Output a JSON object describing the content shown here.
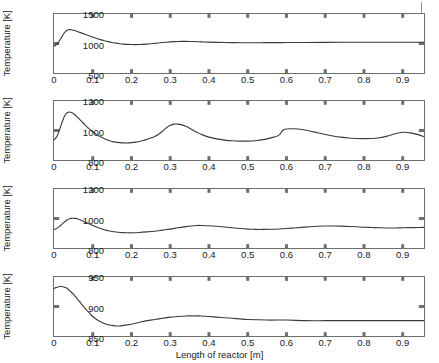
{
  "figure": {
    "xlabel": "Length of reactor [m]",
    "ylabel": "Temperature [K]",
    "x_ticks": [
      "0",
      "0.1",
      "0.2",
      "0.3",
      "0.4",
      "0.5",
      "0.6",
      "0.7",
      "0.8",
      "0.9"
    ],
    "x_tick_values": [
      0,
      0.1,
      0.2,
      0.3,
      0.4,
      0.5,
      0.6,
      0.7,
      0.8,
      0.9
    ],
    "xlim": [
      0,
      0.955
    ],
    "line_color": "#3a3a3a",
    "axis_color": "#6e6e6e"
  },
  "chart_data": [
    {
      "type": "line",
      "title": "",
      "xlabel": "",
      "ylabel": "Temperature [K]",
      "xlim": [
        0,
        0.955
      ],
      "ylim": [
        500,
        1500
      ],
      "y_ticks": [
        500,
        1000,
        1500
      ],
      "y_tick_labels": [
        "500",
        "1000",
        "1500"
      ],
      "grid": false,
      "legend": null,
      "series": [
        {
          "name": "Temperature profile 1",
          "x": [
            0,
            0.005,
            0.01,
            0.015,
            0.02,
            0.025,
            0.03,
            0.035,
            0.04,
            0.045,
            0.05,
            0.06,
            0.07,
            0.08,
            0.09,
            0.1,
            0.11,
            0.12,
            0.13,
            0.14,
            0.15,
            0.16,
            0.17,
            0.18,
            0.19,
            0.2,
            0.21,
            0.22,
            0.23,
            0.24,
            0.25,
            0.26,
            0.27,
            0.28,
            0.29,
            0.3,
            0.31,
            0.32,
            0.33,
            0.34,
            0.35,
            0.36,
            0.38,
            0.4,
            0.42,
            0.44,
            0.46,
            0.48,
            0.5,
            0.55,
            0.6,
            0.65,
            0.7,
            0.75,
            0.8,
            0.85,
            0.9,
            0.955
          ],
          "y": [
            950,
            975,
            1010,
            1055,
            1110,
            1165,
            1205,
            1228,
            1235,
            1232,
            1225,
            1205,
            1180,
            1155,
            1130,
            1108,
            1086,
            1066,
            1048,
            1032,
            1018,
            1006,
            997,
            990,
            985,
            982,
            981,
            982,
            985,
            989,
            995,
            1002,
            1009,
            1016,
            1022,
            1027,
            1031,
            1034,
            1036,
            1036,
            1035,
            1033,
            1028,
            1023,
            1019,
            1016,
            1014,
            1013,
            1013,
            1014,
            1016,
            1018,
            1019,
            1020,
            1021,
            1021,
            1021,
            1021
          ]
        }
      ]
    },
    {
      "type": "line",
      "title": "",
      "xlabel": "",
      "ylabel": "Temperature [K]",
      "xlim": [
        0,
        0.955
      ],
      "ylim": [
        800,
        1200
      ],
      "y_ticks": [
        800,
        1000,
        1200
      ],
      "y_tick_labels": [
        "800",
        "1000",
        "1200"
      ],
      "grid": false,
      "legend": null,
      "series": [
        {
          "name": "Temperature profile 2",
          "x": [
            0,
            0.005,
            0.01,
            0.015,
            0.02,
            0.025,
            0.03,
            0.035,
            0.04,
            0.045,
            0.05,
            0.06,
            0.07,
            0.08,
            0.09,
            0.1,
            0.11,
            0.12,
            0.13,
            0.14,
            0.15,
            0.16,
            0.17,
            0.18,
            0.19,
            0.2,
            0.21,
            0.22,
            0.23,
            0.24,
            0.25,
            0.26,
            0.27,
            0.28,
            0.29,
            0.3,
            0.31,
            0.32,
            0.33,
            0.34,
            0.35,
            0.36,
            0.37,
            0.38,
            0.4,
            0.42,
            0.44,
            0.46,
            0.48,
            0.5,
            0.52,
            0.54,
            0.56,
            0.58,
            0.59,
            0.6,
            0.62,
            0.64,
            0.66,
            0.68,
            0.7,
            0.72,
            0.74,
            0.76,
            0.78,
            0.8,
            0.82,
            0.84,
            0.86,
            0.88,
            0.9,
            0.92,
            0.94,
            0.955
          ],
          "y": [
            935,
            950,
            975,
            1010,
            1050,
            1085,
            1110,
            1122,
            1125,
            1122,
            1115,
            1092,
            1065,
            1038,
            1013,
            992,
            972,
            957,
            944,
            934,
            926,
            921,
            918,
            916,
            916,
            918,
            921,
            926,
            932,
            940,
            949,
            960,
            975,
            995,
            1018,
            1035,
            1043,
            1043,
            1038,
            1028,
            1015,
            1000,
            986,
            974,
            955,
            943,
            935,
            930,
            928,
            928,
            931,
            938,
            950,
            967,
            1000,
            1010,
            1012,
            1007,
            997,
            985,
            973,
            963,
            955,
            949,
            946,
            945,
            946,
            951,
            962,
            978,
            988,
            984,
            972,
            958
          ]
        }
      ]
    },
    {
      "type": "line",
      "title": "",
      "xlabel": "",
      "ylabel": "Temperature [K]",
      "xlim": [
        0,
        0.955
      ],
      "ylim": [
        800,
        1200
      ],
      "y_ticks": [
        800,
        1000,
        1200
      ],
      "y_tick_labels": [
        "800",
        "1000",
        "1200"
      ],
      "grid": false,
      "legend": null,
      "series": [
        {
          "name": "Temperature profile 3",
          "x": [
            0,
            0.005,
            0.01,
            0.015,
            0.02,
            0.025,
            0.03,
            0.035,
            0.04,
            0.045,
            0.05,
            0.055,
            0.06,
            0.07,
            0.08,
            0.09,
            0.1,
            0.11,
            0.12,
            0.13,
            0.14,
            0.15,
            0.16,
            0.17,
            0.18,
            0.19,
            0.2,
            0.22,
            0.24,
            0.26,
            0.28,
            0.3,
            0.32,
            0.34,
            0.36,
            0.37,
            0.38,
            0.4,
            0.42,
            0.44,
            0.46,
            0.48,
            0.5,
            0.51,
            0.52,
            0.54,
            0.56,
            0.58,
            0.6,
            0.62,
            0.64,
            0.66,
            0.68,
            0.7,
            0.72,
            0.74,
            0.76,
            0.78,
            0.8,
            0.82,
            0.84,
            0.86,
            0.88,
            0.9,
            0.92,
            0.94,
            0.955
          ],
          "y": [
            925,
            930,
            938,
            948,
            960,
            972,
            983,
            992,
            998,
            1001,
            1002,
            1001,
            998,
            988,
            977,
            965,
            953,
            942,
            932,
            924,
            917,
            912,
            908,
            905,
            904,
            903,
            903,
            905,
            909,
            914,
            921,
            928,
            937,
            945,
            951,
            953,
            953,
            951,
            947,
            942,
            937,
            932,
            928,
            927,
            926,
            926,
            927,
            929,
            932,
            936,
            940,
            944,
            947,
            949,
            949,
            948,
            946,
            944,
            941,
            939,
            937,
            936,
            936,
            937,
            938,
            939,
            940
          ]
        }
      ]
    },
    {
      "type": "line",
      "title": "",
      "xlabel": "Length of reactor [m]",
      "ylabel": "Temperature [K]",
      "xlim": [
        0,
        0.955
      ],
      "ylim": [
        850,
        950
      ],
      "y_ticks": [
        850,
        900,
        950
      ],
      "y_tick_labels": [
        "850",
        "900",
        "950"
      ],
      "grid": false,
      "legend": null,
      "series": [
        {
          "name": "Temperature profile 4",
          "x": [
            0,
            0.005,
            0.01,
            0.015,
            0.02,
            0.025,
            0.03,
            0.035,
            0.04,
            0.05,
            0.06,
            0.07,
            0.08,
            0.09,
            0.1,
            0.11,
            0.12,
            0.13,
            0.14,
            0.15,
            0.16,
            0.17,
            0.18,
            0.19,
            0.2,
            0.22,
            0.24,
            0.26,
            0.28,
            0.3,
            0.32,
            0.34,
            0.36,
            0.38,
            0.4,
            0.42,
            0.44,
            0.46,
            0.48,
            0.5,
            0.55,
            0.6,
            0.65,
            0.7,
            0.75,
            0.8,
            0.85,
            0.9,
            0.955
          ],
          "y": [
            930,
            932,
            933,
            934,
            934,
            933,
            932,
            930,
            927,
            921,
            913,
            905,
            897,
            890,
            883,
            878,
            874,
            871,
            869,
            868,
            867,
            867,
            868,
            869,
            870,
            873,
            876,
            878,
            880,
            882,
            883,
            884,
            884,
            884,
            883,
            882,
            881,
            880,
            879,
            878,
            877,
            877,
            876,
            876,
            876,
            876,
            876,
            876,
            876
          ]
        }
      ]
    }
  ]
}
